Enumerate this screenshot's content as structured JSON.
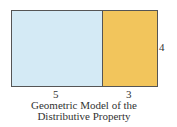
{
  "diagram": {
    "title": "Geometric Model of the Distributive Property",
    "caption_lines": [
      "Geometric Model of the",
      "Distributive Property"
    ],
    "regions": [
      {
        "name": "left-rectangle",
        "width_label": "5",
        "color": "#d4eaf5"
      },
      {
        "name": "right-rectangle",
        "width_label": "3",
        "color": "#f2c55c"
      }
    ],
    "height_label": "4",
    "border_color": "#555555"
  }
}
